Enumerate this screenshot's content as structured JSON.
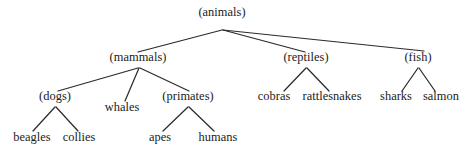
{
  "diagram": {
    "kind": "taxonomy-tree",
    "orientation": "top-down",
    "canvas": {
      "width": 473,
      "height": 154
    },
    "background_color": "#ffffff",
    "text_color": "#1b1b1b",
    "edge_color": "#2b2b2b",
    "nodes": [
      {
        "id": "animals",
        "label": "(animals)",
        "type": "internal",
        "x": 222,
        "y": 18,
        "level": 0
      },
      {
        "id": "mammals",
        "label": "(mammals)",
        "type": "internal",
        "x": 138,
        "y": 63,
        "level": 1
      },
      {
        "id": "reptiles",
        "label": "(reptiles)",
        "type": "internal",
        "x": 306,
        "y": 63,
        "level": 1
      },
      {
        "id": "fish",
        "label": "(fish)",
        "type": "internal",
        "x": 418,
        "y": 63,
        "level": 1
      },
      {
        "id": "dogs",
        "label": "(dogs)",
        "type": "internal",
        "x": 55,
        "y": 102,
        "level": 2
      },
      {
        "id": "whales",
        "label": "whales",
        "type": "leaf",
        "x": 122,
        "y": 113,
        "level": 2
      },
      {
        "id": "primates",
        "label": "(primates)",
        "type": "internal",
        "x": 188,
        "y": 102,
        "level": 2
      },
      {
        "id": "cobras",
        "label": "cobras",
        "type": "leaf",
        "x": 274,
        "y": 102,
        "level": 2
      },
      {
        "id": "rattlesnakes",
        "label": "rattlesnakes",
        "type": "leaf",
        "x": 332,
        "y": 102,
        "level": 2
      },
      {
        "id": "sharks",
        "label": "sharks",
        "type": "leaf",
        "x": 396,
        "y": 102,
        "level": 2
      },
      {
        "id": "salmon",
        "label": "salmon",
        "type": "leaf",
        "x": 441,
        "y": 102,
        "level": 2
      },
      {
        "id": "beagles",
        "label": "beagles",
        "type": "leaf",
        "x": 32,
        "y": 143,
        "level": 3
      },
      {
        "id": "collies",
        "label": "collies",
        "type": "leaf",
        "x": 79,
        "y": 143,
        "level": 3
      },
      {
        "id": "apes",
        "label": "apes",
        "type": "leaf",
        "x": 160,
        "y": 143,
        "level": 3
      },
      {
        "id": "humans",
        "label": "humans",
        "type": "leaf",
        "x": 218,
        "y": 143,
        "level": 3
      }
    ],
    "edges": [
      {
        "from": "animals",
        "to": "mammals",
        "x1": 222,
        "y1": 30,
        "x2": 138,
        "y2": 52
      },
      {
        "from": "animals",
        "to": "reptiles",
        "x1": 223,
        "y1": 30,
        "x2": 305,
        "y2": 52
      },
      {
        "from": "animals",
        "to": "fish",
        "x1": 223,
        "y1": 30,
        "x2": 424,
        "y2": 51
      },
      {
        "from": "mammals",
        "to": "dogs",
        "x1": 138,
        "y1": 68,
        "x2": 58,
        "y2": 91
      },
      {
        "from": "mammals",
        "to": "whales",
        "x1": 139,
        "y1": 68,
        "x2": 125,
        "y2": 101
      },
      {
        "from": "mammals",
        "to": "primates",
        "x1": 140,
        "y1": 68,
        "x2": 189,
        "y2": 91
      },
      {
        "from": "dogs",
        "to": "beagles",
        "x1": 55,
        "y1": 107,
        "x2": 33,
        "y2": 131
      },
      {
        "from": "dogs",
        "to": "collies",
        "x1": 56,
        "y1": 107,
        "x2": 78,
        "y2": 131
      },
      {
        "from": "primates",
        "to": "apes",
        "x1": 188,
        "y1": 107,
        "x2": 163,
        "y2": 131
      },
      {
        "from": "primates",
        "to": "humans",
        "x1": 189,
        "y1": 107,
        "x2": 214,
        "y2": 131
      },
      {
        "from": "reptiles",
        "to": "cobras",
        "x1": 306,
        "y1": 68,
        "x2": 284,
        "y2": 91
      },
      {
        "from": "reptiles",
        "to": "rattlesnakes",
        "x1": 307,
        "y1": 68,
        "x2": 329,
        "y2": 91
      },
      {
        "from": "fish",
        "to": "sharks",
        "x1": 418,
        "y1": 68,
        "x2": 402,
        "y2": 91
      },
      {
        "from": "fish",
        "to": "salmon",
        "x1": 419,
        "y1": 68,
        "x2": 435,
        "y2": 91
      }
    ]
  }
}
